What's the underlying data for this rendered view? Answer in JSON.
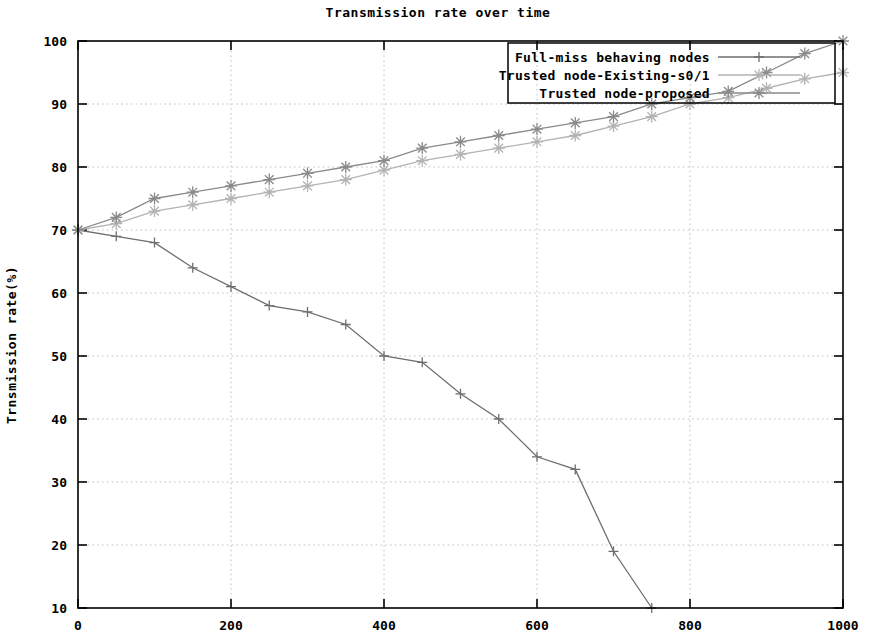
{
  "chart_data": {
    "type": "line",
    "title": "Transmission rate over time",
    "xlabel": "",
    "ylabel": "Trnsmission rate(%)",
    "xlim": [
      0,
      1000
    ],
    "ylim": [
      10,
      100
    ],
    "xticks": [
      0,
      200,
      400,
      600,
      800,
      1000
    ],
    "xtick_labels": [
      "0",
      "200",
      "400",
      "600",
      "800",
      "1000"
    ],
    "yticks": [
      10,
      20,
      30,
      40,
      50,
      60,
      70,
      80,
      90,
      100
    ],
    "ytick_labels": [
      "10",
      "20",
      "30",
      "40",
      "50",
      "60",
      "70",
      "80",
      "90",
      "100"
    ],
    "grid": true,
    "legend_position": "top-right",
    "series": [
      {
        "name": "Full-miss behaving nodes",
        "marker": "plus",
        "color": "#6e6e6e",
        "x": [
          0,
          50,
          100,
          150,
          200,
          250,
          300,
          350,
          400,
          450,
          500,
          550,
          600,
          650,
          700,
          750
        ],
        "values": [
          70,
          69,
          68,
          64,
          61,
          58,
          57,
          55,
          50,
          49,
          44,
          40,
          34,
          32,
          19,
          10
        ]
      },
      {
        "name": "Trusted node-Existing-s0/1",
        "marker": "star",
        "color": "#b3b3b3",
        "x": [
          0,
          50,
          100,
          150,
          200,
          250,
          300,
          350,
          400,
          450,
          500,
          550,
          600,
          650,
          700,
          750,
          800,
          850,
          900,
          950,
          1000
        ],
        "values": [
          70,
          71,
          73,
          74,
          75,
          76,
          77,
          78,
          79.5,
          81,
          82,
          83,
          84,
          85,
          86.5,
          88,
          90,
          91,
          92.5,
          94,
          95
        ]
      },
      {
        "name": "Trusted node-proposed",
        "marker": "star",
        "color": "#8a8a8a",
        "x": [
          0,
          50,
          100,
          150,
          200,
          250,
          300,
          350,
          400,
          450,
          500,
          550,
          600,
          650,
          700,
          750,
          800,
          850,
          900,
          950,
          1000
        ],
        "values": [
          70,
          72,
          75,
          76,
          77,
          78,
          79,
          80,
          81,
          83,
          84,
          85,
          86,
          87,
          88,
          90,
          91,
          92,
          95,
          98,
          100
        ]
      }
    ]
  },
  "legend": {
    "entries": [
      "Full-miss behaving nodes",
      "Trusted node-Existing-s0/1",
      "Trusted node-proposed"
    ]
  }
}
